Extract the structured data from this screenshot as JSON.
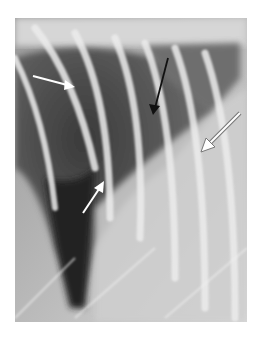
{
  "figure": {
    "kind": "thoracic radiograph",
    "colors": {
      "background": "#ffffff",
      "soft_tissue": "#c8c8c8",
      "lung_dark": "#2e2e2e",
      "rib": "#e6e6e6"
    },
    "annotations": [
      {
        "name": "white-arrow-upper-left",
        "color": "#ffffff",
        "direction": "pointing right-down"
      },
      {
        "name": "black-arrow-upper-middle",
        "color": "#1a1a1a",
        "direction": "pointing down-left"
      },
      {
        "name": "outlined-arrow-right",
        "color": "#ffffff",
        "outline": "#777777",
        "direction": "pointing down-left"
      },
      {
        "name": "white-arrow-lower-middle",
        "color": "#ffffff",
        "direction": "pointing up-right"
      }
    ]
  }
}
